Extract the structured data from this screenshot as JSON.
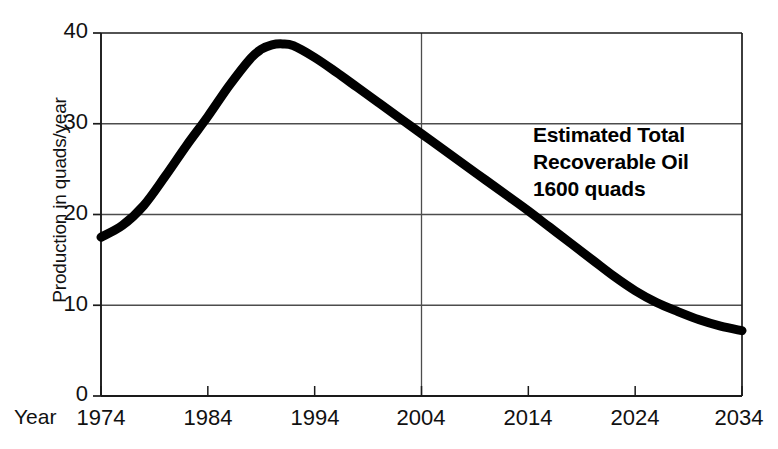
{
  "chart_data": {
    "type": "line",
    "title": "",
    "subtitle": "",
    "xlabel": "Year",
    "ylabel": "Production in quads/year",
    "xlim": [
      1974,
      2034
    ],
    "ylim": [
      0,
      40
    ],
    "xticks": [
      "1974",
      "1984",
      "1994",
      "2004",
      "2014",
      "2024",
      "2034"
    ],
    "xtick_values": [
      1974,
      1984,
      1994,
      2004,
      2014,
      2024,
      2034
    ],
    "yticks": [
      "0",
      "10",
      "20",
      "30",
      "40"
    ],
    "ytick_values": [
      0,
      10,
      20,
      30,
      40
    ],
    "grid": "horizontal gridlines at 10, 20, 30, 40; single vertical gridline at 2004",
    "gridlines_y": [
      10,
      20,
      30,
      40
    ],
    "gridlines_x": [
      2004
    ],
    "legend": "none",
    "line_color": "#000000",
    "line_width_px": 9,
    "series": [
      {
        "name": "Oil production",
        "x": [
          1974,
          1976,
          1978,
          1980,
          1982,
          1984,
          1986,
          1988,
          1989,
          1990,
          1991,
          1992,
          1994,
          1996,
          1998,
          2000,
          2002,
          2004,
          2006,
          2008,
          2010,
          2012,
          2014,
          2016,
          2018,
          2020,
          2022,
          2024,
          2026,
          2028,
          2030,
          2032,
          2034
        ],
        "values": [
          17.5,
          18.8,
          21.0,
          24.2,
          27.6,
          30.8,
          34.2,
          37.2,
          38.2,
          38.7,
          38.8,
          38.6,
          37.3,
          35.7,
          34.0,
          32.3,
          30.6,
          28.9,
          27.2,
          25.5,
          23.8,
          22.1,
          20.4,
          18.6,
          16.8,
          15.0,
          13.2,
          11.6,
          10.3,
          9.3,
          8.4,
          7.7,
          7.2
        ]
      }
    ],
    "annotations": [
      {
        "text_lines": [
          "Estimated Total",
          "Recoverable Oil",
          "1600 quads"
        ],
        "at_x": 2016,
        "at_y": 24,
        "bold": true
      }
    ]
  },
  "axis": {
    "year_prefix_label": "Year"
  },
  "annotation": {
    "line1": "Estimated Total",
    "line2": "Recoverable Oil",
    "line3": "1600 quads"
  },
  "colors": {
    "curve": "#000000",
    "axis": "#1a1a1a",
    "grid": "#4d4d4d",
    "background": "#ffffff",
    "text": "#111111"
  }
}
